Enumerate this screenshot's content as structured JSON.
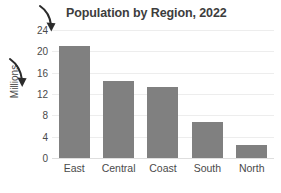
{
  "chart_data": {
    "type": "bar",
    "title": "Population by Region, 2022",
    "xlabel": "",
    "ylabel": "Millions",
    "categories": [
      "East",
      "Central",
      "Coast",
      "South",
      "North"
    ],
    "values": [
      21.0,
      14.5,
      13.3,
      6.8,
      2.5
    ],
    "ylim": [
      0,
      24
    ],
    "yticks": [
      0,
      4,
      8,
      12,
      16,
      20,
      24
    ],
    "ytick_labels": [
      "0",
      "4",
      "8",
      "12",
      "16",
      "20",
      "24"
    ],
    "grid": true,
    "legend": false,
    "legend_position": "none",
    "bar_color": "#808080",
    "gridline_color": "#ededed",
    "background_color": "#ffffff",
    "text_color": "#4a4a4a",
    "annotations": [
      {
        "name": "arrow-to-top-tick",
        "kind": "hand-drawn-curved-arrow",
        "points_at": "24",
        "color": "#2b2b2b"
      },
      {
        "name": "arrow-to-axis-title",
        "kind": "hand-drawn-curved-arrow",
        "points_at": "Millions",
        "color": "#2b2b2b"
      }
    ]
  }
}
